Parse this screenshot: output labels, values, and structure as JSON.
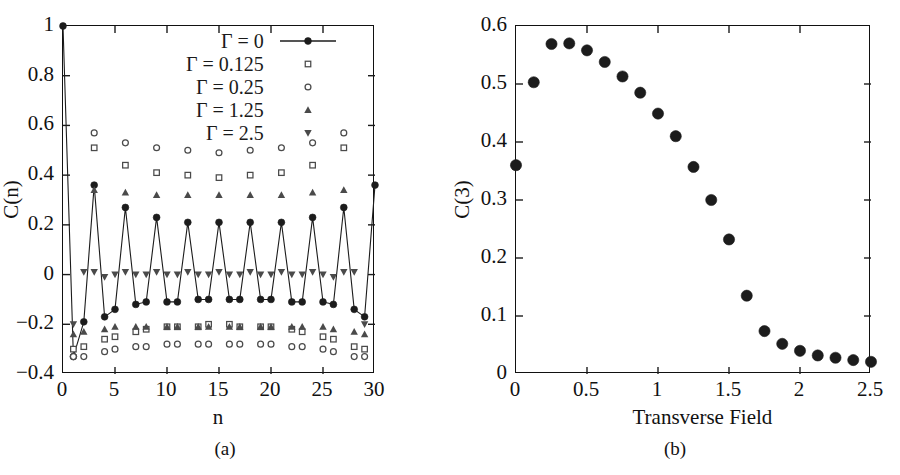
{
  "figure": {
    "panel_a_caption": "(a)",
    "panel_b_caption": "(b)"
  },
  "chart_data": [
    {
      "type": "scatter",
      "panel": "(a)",
      "title": "",
      "xlabel": "n",
      "ylabel": "C(n)",
      "xlim": [
        0,
        30
      ],
      "ylim": [
        -0.4,
        1.0
      ],
      "xticks": [
        0,
        5,
        10,
        15,
        20,
        25,
        30
      ],
      "xtick_labels": [
        "0",
        "5",
        "10",
        "15",
        "20",
        "25",
        "30"
      ],
      "yticks": [
        -0.4,
        -0.2,
        0,
        0.2,
        0.4,
        0.6,
        0.8,
        1
      ],
      "ytick_labels": [
        "-0.4",
        "-0.2",
        "0",
        "0.2",
        "0.4",
        "0.6",
        "0.8",
        "1"
      ],
      "grid": false,
      "legend_position": "top-right",
      "series": [
        {
          "name": "Γ = 0",
          "marker": "filled-circle",
          "line": true,
          "x": [
            0,
            1,
            2,
            3,
            4,
            5,
            6,
            7,
            8,
            9,
            10,
            11,
            12,
            13,
            14,
            15,
            16,
            17,
            18,
            19,
            20,
            21,
            22,
            23,
            24,
            25,
            26,
            27,
            28,
            29,
            30
          ],
          "y": [
            1.0,
            -0.33,
            -0.19,
            0.36,
            -0.17,
            -0.14,
            0.27,
            -0.12,
            -0.11,
            0.23,
            -0.11,
            -0.11,
            0.21,
            -0.1,
            -0.1,
            0.21,
            -0.1,
            -0.1,
            0.21,
            -0.1,
            -0.1,
            0.21,
            -0.11,
            -0.11,
            0.23,
            -0.11,
            -0.12,
            0.27,
            -0.14,
            -0.17,
            0.36,
            -0.19,
            -0.33,
            1.0
          ]
        },
        {
          "name": "Γ = 0.125",
          "marker": "open-square",
          "line": false,
          "x": [
            1,
            2,
            3,
            4,
            5,
            6,
            7,
            8,
            9,
            10,
            11,
            12,
            13,
            14,
            15,
            16,
            17,
            18,
            19,
            20,
            21,
            22,
            23,
            24,
            25,
            26,
            27,
            28,
            29
          ],
          "y": [
            -0.3,
            -0.29,
            0.51,
            -0.26,
            -0.25,
            0.44,
            -0.23,
            -0.22,
            0.41,
            -0.21,
            -0.21,
            0.4,
            -0.21,
            -0.2,
            0.39,
            -0.2,
            -0.21,
            0.4,
            -0.21,
            -0.21,
            0.41,
            -0.22,
            -0.23,
            0.44,
            -0.25,
            -0.26,
            0.51,
            -0.29,
            -0.3
          ]
        },
        {
          "name": "Γ = 0.25",
          "marker": "open-circle",
          "line": false,
          "x": [
            1,
            2,
            3,
            4,
            5,
            6,
            7,
            8,
            9,
            10,
            11,
            12,
            13,
            14,
            15,
            16,
            17,
            18,
            19,
            20,
            21,
            22,
            23,
            24,
            25,
            26,
            27,
            28,
            29
          ],
          "y": [
            -0.33,
            -0.33,
            0.57,
            -0.31,
            -0.3,
            0.53,
            -0.29,
            -0.29,
            0.51,
            -0.28,
            -0.28,
            0.5,
            -0.28,
            -0.28,
            0.49,
            -0.28,
            -0.28,
            0.5,
            -0.28,
            -0.28,
            0.51,
            -0.29,
            -0.29,
            0.53,
            -0.3,
            -0.31,
            0.57,
            -0.33,
            -0.33
          ]
        },
        {
          "name": "Γ = 1.25",
          "marker": "filled-triangle-up",
          "line": false,
          "x": [
            1,
            2,
            3,
            4,
            5,
            6,
            7,
            8,
            9,
            10,
            11,
            12,
            13,
            14,
            15,
            16,
            17,
            18,
            19,
            20,
            21,
            22,
            23,
            24,
            25,
            26,
            27,
            28,
            29
          ],
          "y": [
            -0.24,
            -0.23,
            0.34,
            -0.22,
            -0.21,
            0.33,
            -0.21,
            -0.21,
            0.32,
            -0.21,
            -0.21,
            0.32,
            -0.21,
            -0.21,
            0.32,
            -0.21,
            -0.21,
            0.32,
            -0.21,
            -0.21,
            0.32,
            -0.21,
            -0.21,
            0.33,
            -0.21,
            -0.22,
            0.34,
            -0.23,
            -0.24
          ]
        },
        {
          "name": "Γ = 2.5",
          "marker": "filled-triangle-down",
          "line": false,
          "x": [
            1,
            2,
            3,
            4,
            5,
            6,
            7,
            8,
            9,
            10,
            11,
            12,
            13,
            14,
            15,
            16,
            17,
            18,
            19,
            20,
            21,
            22,
            23,
            24,
            25,
            26,
            27,
            28,
            29
          ],
          "y": [
            -0.2,
            0.01,
            0.01,
            -0.01,
            0.0,
            0.01,
            0.0,
            0.0,
            0.01,
            0.0,
            0.0,
            0.01,
            0.0,
            0.0,
            0.01,
            0.0,
            0.0,
            0.01,
            0.0,
            0.0,
            0.01,
            0.0,
            0.0,
            0.01,
            0.0,
            -0.01,
            0.01,
            0.01,
            -0.2
          ]
        }
      ]
    },
    {
      "type": "scatter",
      "panel": "(b)",
      "title": "",
      "xlabel": "Transverse Field",
      "ylabel": "C(3)",
      "xlim": [
        0,
        2.5
      ],
      "ylim": [
        0,
        0.6
      ],
      "xticks": [
        0,
        0.5,
        1,
        1.5,
        2,
        2.5
      ],
      "xtick_labels": [
        "0",
        "0.5",
        "1",
        "1.5",
        "2",
        "2.5"
      ],
      "yticks": [
        0,
        0.1,
        0.2,
        0.3,
        0.4,
        0.5,
        0.6
      ],
      "ytick_labels": [
        "0",
        "0.1",
        "0.2",
        "0.3",
        "0.4",
        "0.5",
        "0.6"
      ],
      "grid": false,
      "legend_position": "none",
      "series": [
        {
          "name": "C(3)",
          "marker": "filled-circle",
          "line": false,
          "x": [
            0.0,
            0.125,
            0.25,
            0.375,
            0.5,
            0.625,
            0.75,
            0.875,
            1.0,
            1.125,
            1.25,
            1.375,
            1.5,
            1.625,
            1.75,
            1.875,
            2.0,
            2.125,
            2.25,
            2.375,
            2.5
          ],
          "y": [
            0.36,
            0.503,
            0.569,
            0.57,
            0.558,
            0.538,
            0.513,
            0.485,
            0.449,
            0.41,
            0.357,
            0.3,
            0.232,
            0.135,
            0.074,
            0.052,
            0.04,
            0.032,
            0.028,
            0.024,
            0.021
          ]
        }
      ]
    }
  ]
}
